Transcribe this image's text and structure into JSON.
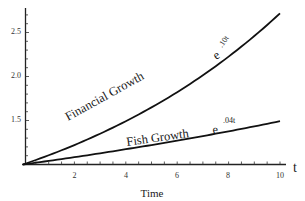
{
  "chart_data": {
    "type": "line",
    "title": "",
    "xlabel": "Time",
    "ylabel": "",
    "x_axis_end_label": "t",
    "xlim": [
      0,
      10
    ],
    "ylim": [
      1.0,
      2.75
    ],
    "x_ticks": [
      2,
      4,
      6,
      8,
      10
    ],
    "y_ticks": [
      1.5,
      2.0,
      2.5
    ],
    "grid": false,
    "legend": "none (inline curve labels)",
    "x": [
      0,
      1,
      2,
      3,
      4,
      5,
      6,
      7,
      8,
      9,
      10
    ],
    "series": [
      {
        "name": "Financial Growth e^.10t",
        "label_text": "Financial   Growth",
        "label_exp_base": "e",
        "label_exp": ".10t",
        "formula": "e^(0.10 t)",
        "values": [
          1.0,
          1.105,
          1.221,
          1.35,
          1.492,
          1.649,
          1.822,
          2.014,
          2.226,
          2.46,
          2.718
        ]
      },
      {
        "name": "Fish Growth e^.04t",
        "label_text": "Fish  Growth",
        "label_exp_base": "e",
        "label_exp": ".04t",
        "formula": "e^(0.04 t)",
        "values": [
          1.0,
          1.041,
          1.083,
          1.127,
          1.174,
          1.221,
          1.271,
          1.323,
          1.377,
          1.433,
          1.492
        ]
      }
    ]
  },
  "labels": {
    "y_tick_1_5": "1.5",
    "y_tick_2_0": "2.0",
    "y_tick_2_5": "2.5",
    "x_tick_2": "2",
    "x_tick_4": "4",
    "x_tick_6": "6",
    "x_tick_8": "8",
    "x_tick_10": "10",
    "xlabel": "Time",
    "t": "t",
    "financial": "Financial   Growth",
    "financial_e": "e",
    "financial_exp": ".10t",
    "fish": "Fish  Growth",
    "fish_e": "e",
    "fish_exp": ".04t"
  }
}
